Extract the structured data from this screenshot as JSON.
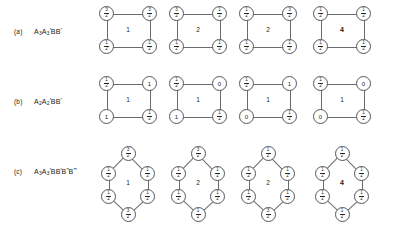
{
  "figure": {
    "background_color": "#ffffff",
    "stroke_color": "#55565a",
    "text_color": "#1a1a1a",
    "rows": [
      {
        "tag": "(a)",
        "formula_plain": "A3A3'BB'",
        "shape": "square",
        "diagrams": [
          {
            "center": "1",
            "center_bold": false,
            "nodes": [
              {
                "position": "top-left",
                "value": "3/2"
              },
              {
                "position": "top-right",
                "value": "3/2"
              },
              {
                "position": "bottom-left",
                "value": "1/2"
              },
              {
                "position": "bottom-right",
                "value": "1/2"
              }
            ]
          },
          {
            "center": "2",
            "center_bold": false,
            "nodes": [
              {
                "position": "top-left",
                "value": "3/2"
              },
              {
                "position": "top-right",
                "value": "1/2"
              },
              {
                "position": "bottom-left",
                "value": "1/2"
              },
              {
                "position": "bottom-right",
                "value": "1/2"
              }
            ]
          },
          {
            "center": "2",
            "center_bold": false,
            "nodes": [
              {
                "position": "top-left",
                "value": "1/2"
              },
              {
                "position": "top-right",
                "value": "3/2"
              },
              {
                "position": "bottom-left",
                "value": "1/2"
              },
              {
                "position": "bottom-right",
                "value": "1/2"
              }
            ]
          },
          {
            "center": "4",
            "center_bold": true,
            "nodes": [
              {
                "position": "top-left",
                "value": "1/2"
              },
              {
                "position": "top-right",
                "value": "1/2"
              },
              {
                "position": "bottom-left",
                "value": "1/2"
              },
              {
                "position": "bottom-right",
                "value": "1/2"
              }
            ]
          }
        ]
      },
      {
        "tag": "(b)",
        "formula_plain": "A2A2'BB'",
        "shape": "square",
        "diagrams": [
          {
            "center": "1",
            "center_bold": false,
            "nodes": [
              {
                "position": "top-left",
                "value": "1/2"
              },
              {
                "position": "top-right",
                "value": "1"
              },
              {
                "position": "bottom-left",
                "value": "1"
              },
              {
                "position": "bottom-right",
                "value": "1/2"
              }
            ]
          },
          {
            "center": "1",
            "center_bold": false,
            "nodes": [
              {
                "position": "top-left",
                "value": "1/2"
              },
              {
                "position": "top-right",
                "value": "0"
              },
              {
                "position": "bottom-left",
                "value": "1"
              },
              {
                "position": "bottom-right",
                "value": "1/2"
              }
            ]
          },
          {
            "center": "1",
            "center_bold": false,
            "nodes": [
              {
                "position": "top-left",
                "value": "1/2"
              },
              {
                "position": "top-right",
                "value": "1"
              },
              {
                "position": "bottom-left",
                "value": "0"
              },
              {
                "position": "bottom-right",
                "value": "1/2"
              }
            ]
          },
          {
            "center": "1",
            "center_bold": false,
            "nodes": [
              {
                "position": "top-left",
                "value": "1/2"
              },
              {
                "position": "top-right",
                "value": "0"
              },
              {
                "position": "bottom-left",
                "value": "0"
              },
              {
                "position": "bottom-right",
                "value": "1/2"
              }
            ]
          }
        ]
      },
      {
        "tag": "(c)",
        "formula_plain": "A3A3'BB'B''B'''",
        "shape": "hexagon",
        "diagrams": [
          {
            "center": "1",
            "center_bold": false,
            "nodes": [
              {
                "position": "top",
                "value": "3/2"
              },
              {
                "position": "upper-left",
                "value": "1/2"
              },
              {
                "position": "upper-right",
                "value": "1/2"
              },
              {
                "position": "lower-left",
                "value": "1/2"
              },
              {
                "position": "lower-right",
                "value": "1/2"
              },
              {
                "position": "bottom",
                "value": "3/2"
              }
            ]
          },
          {
            "center": "2",
            "center_bold": false,
            "nodes": [
              {
                "position": "top",
                "value": "3/2"
              },
              {
                "position": "upper-left",
                "value": "1/2"
              },
              {
                "position": "upper-right",
                "value": "1/2"
              },
              {
                "position": "lower-left",
                "value": "1/2"
              },
              {
                "position": "lower-right",
                "value": "1/2"
              },
              {
                "position": "bottom",
                "value": "1/2"
              }
            ]
          },
          {
            "center": "2",
            "center_bold": false,
            "nodes": [
              {
                "position": "top",
                "value": "1/2"
              },
              {
                "position": "upper-left",
                "value": "1/2"
              },
              {
                "position": "upper-right",
                "value": "1/2"
              },
              {
                "position": "lower-left",
                "value": "1/2"
              },
              {
                "position": "lower-right",
                "value": "1/2"
              },
              {
                "position": "bottom",
                "value": "3/2"
              }
            ]
          },
          {
            "center": "4",
            "center_bold": true,
            "nodes": [
              {
                "position": "top",
                "value": "1/2"
              },
              {
                "position": "upper-left",
                "value": "1/2"
              },
              {
                "position": "upper-right",
                "value": "1/2"
              },
              {
                "position": "lower-left",
                "value": "1/2"
              },
              {
                "position": "lower-right",
                "value": "1/2"
              },
              {
                "position": "bottom",
                "value": "1/2"
              }
            ]
          }
        ]
      }
    ]
  }
}
